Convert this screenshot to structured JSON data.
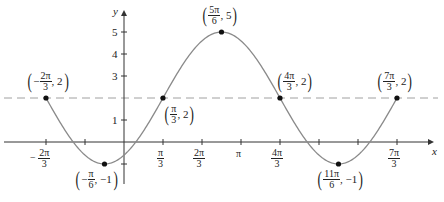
{
  "chart_data": {
    "type": "line",
    "title": "",
    "xlabel": "x",
    "ylabel": "y",
    "function": "y = 2 + 3 sin(x - π/3)",
    "grid": false,
    "xlim": [
      -2.5,
      8.6
    ],
    "ylim": [
      -1.8,
      5.5
    ],
    "x_ticks": [
      "-2π/3",
      "-π/3",
      "π/3",
      "2π/3",
      "π",
      "4π/3",
      "5π/3",
      "2π",
      "7π/3"
    ],
    "x_tick_labels_shown": [
      {
        "num": "2π",
        "den": "3",
        "sign": "-"
      },
      {
        "num": "π",
        "den": "3",
        "sign": ""
      },
      {
        "num": "2π",
        "den": "3",
        "sign": ""
      },
      {
        "text": "π"
      },
      {
        "num": "4π",
        "den": "3",
        "sign": ""
      },
      {
        "num": "7π",
        "den": "3",
        "sign": ""
      }
    ],
    "y_ticks": [
      -1,
      1,
      2,
      3,
      4,
      5
    ],
    "y_tick_labels_shown": [
      "1",
      "3",
      "4",
      "5"
    ],
    "midline": {
      "y": 2,
      "style": "dashed"
    },
    "points": [
      {
        "label_num": "2π",
        "label_den": "3",
        "sign": "-",
        "y": "2",
        "x": -2.094,
        "yv": 2
      },
      {
        "label_num": "π",
        "label_den": "6",
        "sign": "-",
        "y": "-1",
        "x": -0.524,
        "yv": -1
      },
      {
        "label_num": "π",
        "label_den": "3",
        "sign": "",
        "y": "2",
        "x": 1.047,
        "yv": 2
      },
      {
        "label_num": "5π",
        "label_den": "6",
        "sign": "",
        "y": "5",
        "x": 2.618,
        "yv": 5
      },
      {
        "label_num": "4π",
        "label_den": "3",
        "sign": "",
        "y": "2",
        "x": 4.189,
        "yv": 2
      },
      {
        "label_num": "11π",
        "label_den": "6",
        "sign": "",
        "y": "-1",
        "x": 5.76,
        "yv": -1
      },
      {
        "label_num": "7π",
        "label_den": "3",
        "sign": "",
        "y": "2",
        "x": 7.33,
        "yv": 2
      }
    ]
  },
  "axis": {
    "x_label": "x",
    "y_label": "y"
  },
  "labels": {
    "y1": "1",
    "y3": "3",
    "y4": "4",
    "y5": "5",
    "pi": "π",
    "three": "3",
    "two_pi": "2π",
    "four_pi": "4π",
    "seven_pi": "7π",
    "minus": "−",
    "p1": {
      "num": "2π",
      "den": "3",
      "sign": "−",
      "y": "2"
    },
    "p2": {
      "num": "π",
      "den": "6",
      "sign": "−",
      "y": "−1"
    },
    "p3": {
      "num": "π",
      "den": "3",
      "sign": "",
      "y": "2"
    },
    "p4": {
      "num": "5π",
      "den": "6",
      "sign": "",
      "y": "5"
    },
    "p5": {
      "num": "4π",
      "den": "3",
      "sign": "",
      "y": "2"
    },
    "p6": {
      "num": "11π",
      "den": "6",
      "sign": "",
      "y": "−1"
    },
    "p7": {
      "num": "7π",
      "den": "3",
      "sign": "",
      "y": "2"
    }
  },
  "colors": {
    "curve": "#8a8a8a",
    "axis": "#333333",
    "dash": "#9a9a9a",
    "point": "#111111"
  }
}
